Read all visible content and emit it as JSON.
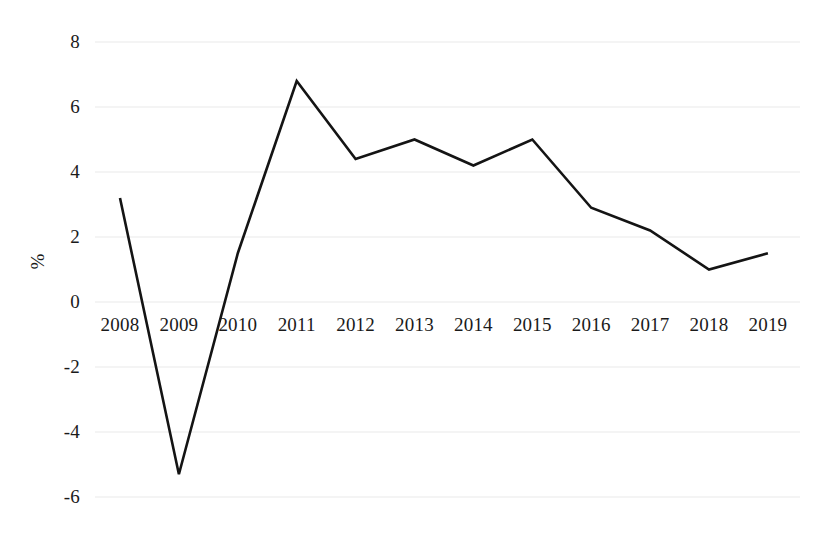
{
  "chart_data": {
    "type": "line",
    "title": "",
    "subtitle": "",
    "xlabel": "",
    "ylabel": "%",
    "categories": [
      "2008",
      "2009",
      "2010",
      "2011",
      "2012",
      "2013",
      "2014",
      "2015",
      "2016",
      "2017",
      "2018",
      "2019"
    ],
    "values": [
      3.2,
      -5.3,
      1.5,
      6.8,
      4.4,
      5.0,
      4.2,
      5.0,
      2.9,
      2.2,
      1.0,
      1.5
    ],
    "series": [
      {
        "name": "",
        "values": [
          3.2,
          -5.3,
          1.5,
          6.8,
          4.4,
          5.0,
          4.2,
          5.0,
          2.9,
          2.2,
          1.0,
          1.5
        ]
      }
    ],
    "ylim": [
      -6,
      8
    ],
    "yticks": [
      8,
      6,
      4,
      2,
      0,
      -2,
      -4,
      -6
    ],
    "ytick_labels": [
      "8",
      "6",
      "4",
      "2",
      "0",
      "-2",
      "-4",
      "-6"
    ],
    "grid": true,
    "grid_axis": "y",
    "legend": false,
    "legend_position": "none",
    "line_color": "#141414",
    "grid_color": "#e9e9e9",
    "background_color": "#ffffff",
    "xaxis_labels_position": "below-zero-line"
  }
}
